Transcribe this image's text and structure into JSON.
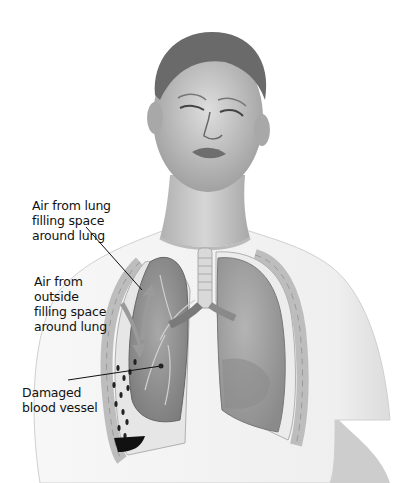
{
  "figure": {
    "labels": [
      {
        "id": "air-from-lung",
        "lines": [
          "Air from lung",
          "filling space",
          "around lung"
        ]
      },
      {
        "id": "air-from-outside",
        "lines": [
          "Air from",
          "outside",
          "filling space",
          "around lung"
        ]
      },
      {
        "id": "damaged-vessel",
        "lines": [
          "Damaged",
          "blood vessel"
        ]
      }
    ]
  },
  "colors": {
    "background": "#ffffff",
    "shirt": "#f2f2f2",
    "skin": "#cfcfcf",
    "lung": "#9a9a9a",
    "lung_dark": "#6e6e6e",
    "blood": "#111111"
  }
}
